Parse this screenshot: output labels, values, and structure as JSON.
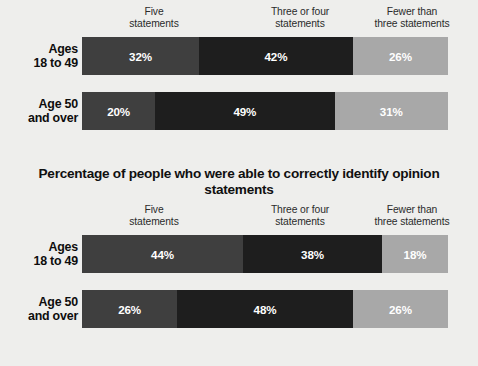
{
  "page": {
    "background_color": "#eeeeec",
    "clipped_top_title": "Percentage of people who were able to correctly identify factual statements"
  },
  "palette": {
    "segment_1": "#3f3f3f",
    "segment_2": "#1e1e1e",
    "segment_3": "#a8a8a8",
    "label_text": "#0d0d0d",
    "value_text": "#ffffff",
    "header_text": "#2b2b2b"
  },
  "charts": [
    {
      "id": "chart-factual",
      "title": "",
      "column_headers": [
        "Five\nstatements",
        "Three or four\nstatements",
        "Fewer than\nthree statements"
      ],
      "rows": [
        {
          "label": "Ages\n18 to 49",
          "values": [
            "32%",
            "42%",
            "26%"
          ]
        },
        {
          "label": "Age 50\nand over",
          "values": [
            "20%",
            "49%",
            "31%"
          ]
        }
      ]
    },
    {
      "id": "chart-opinion",
      "title": "Percentage of people who were able to correctly identify opinion statements",
      "column_headers": [
        "Five\nstatements",
        "Three or four\nstatements",
        "Fewer than\nthree statements"
      ],
      "rows": [
        {
          "label": "Ages\n18 to 49",
          "values": [
            "44%",
            "38%",
            "18%"
          ]
        },
        {
          "label": "Age 50\nand over",
          "values": [
            "26%",
            "48%",
            "26%"
          ]
        }
      ]
    }
  ],
  "chart_data": [
    {
      "type": "bar",
      "orientation": "horizontal",
      "stacked": true,
      "normalized": true,
      "title": "Percentage of people who were able to correctly identify factual statements",
      "xlabel": "",
      "ylabel": "",
      "xlim": [
        0,
        100
      ],
      "grid": false,
      "legend_position": "top",
      "categories": [
        "Ages 18 to 49",
        "Age 50 and over"
      ],
      "series": [
        {
          "name": "Five statements",
          "values": [
            32,
            20
          ],
          "color": "#3f3f3f"
        },
        {
          "name": "Three or four statements",
          "values": [
            42,
            49
          ],
          "color": "#1e1e1e"
        },
        {
          "name": "Fewer than three statements",
          "values": [
            26,
            31
          ],
          "color": "#a8a8a8"
        }
      ],
      "data_labels": [
        [
          "32%",
          "42%",
          "26%"
        ],
        [
          "20%",
          "49%",
          "31%"
        ]
      ]
    },
    {
      "type": "bar",
      "orientation": "horizontal",
      "stacked": true,
      "normalized": true,
      "title": "Percentage of people who were able to correctly identify opinion statements",
      "xlabel": "",
      "ylabel": "",
      "xlim": [
        0,
        100
      ],
      "grid": false,
      "legend_position": "top",
      "categories": [
        "Ages 18 to 49",
        "Age 50 and over"
      ],
      "series": [
        {
          "name": "Five statements",
          "values": [
            44,
            26
          ],
          "color": "#3f3f3f"
        },
        {
          "name": "Three or four statements",
          "values": [
            38,
            48
          ],
          "color": "#1e1e1e"
        },
        {
          "name": "Fewer than three statements",
          "values": [
            18,
            26
          ],
          "color": "#a8a8a8"
        }
      ],
      "data_labels": [
        [
          "44%",
          "38%",
          "18%"
        ],
        [
          "26%",
          "48%",
          "26%"
        ]
      ]
    }
  ]
}
